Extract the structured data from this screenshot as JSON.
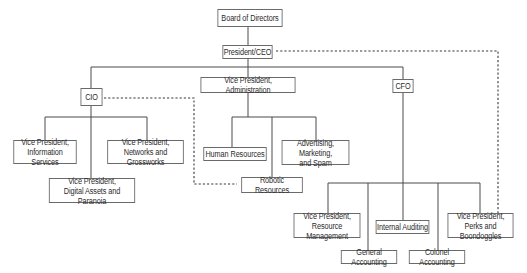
{
  "diagram": {
    "type": "org-chart",
    "nodes": {
      "board": "Board of Directors",
      "ceo": "President/CEO",
      "cio": "CIO",
      "vp_admin": "Vice President, Administration",
      "cfo": "CFO",
      "vp_info": "Vice President,\nInformation Services",
      "vp_networks": "Vice President,\nNetworks and Grossworks",
      "vp_digital": "Vice President,\nDigital Assets and Paranoia",
      "hr": "Human Resources",
      "advertising": "Advertising, Marketing,\nand Spam",
      "robotic": "Robotic Resources",
      "vp_resource": "Vice President,\nResource Management",
      "internal_audit": "Internal Auditing",
      "vp_perks": "Vice President,\nPerks and Boondoggles",
      "general_acct": "General Accounting",
      "colonel_acct": "Colonel Accounting"
    },
    "edges_solid": [
      [
        "board",
        "ceo"
      ],
      [
        "ceo",
        "cio"
      ],
      [
        "ceo",
        "vp_admin"
      ],
      [
        "ceo",
        "cfo"
      ],
      [
        "cio",
        "vp_info"
      ],
      [
        "cio",
        "vp_networks"
      ],
      [
        "cio",
        "vp_digital"
      ],
      [
        "vp_admin",
        "hr"
      ],
      [
        "vp_admin",
        "advertising"
      ],
      [
        "vp_admin",
        "robotic"
      ],
      [
        "cfo",
        "vp_resource"
      ],
      [
        "cfo",
        "general_acct"
      ],
      [
        "cfo",
        "internal_audit"
      ],
      [
        "cfo",
        "colonel_acct"
      ],
      [
        "cfo",
        "vp_perks"
      ]
    ],
    "edges_dotted": [
      [
        "ceo",
        "vp_perks"
      ],
      [
        "cio",
        "robotic"
      ]
    ],
    "caption": ""
  },
  "colors": {
    "line": "#4a4a4a",
    "box_border": "#6a6a6a",
    "text": "#2a2a2a",
    "background": "#ffffff"
  }
}
